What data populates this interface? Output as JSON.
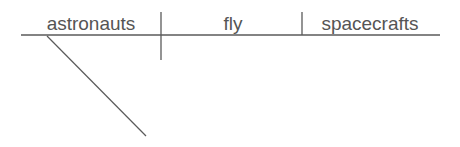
{
  "diagram": {
    "type": "sentence-diagram",
    "line_color": "#5a5a5a",
    "text_color": "#555555",
    "subject": "astronauts",
    "verb": "fly",
    "object": "spacecrafts",
    "modifier_slot": ""
  }
}
